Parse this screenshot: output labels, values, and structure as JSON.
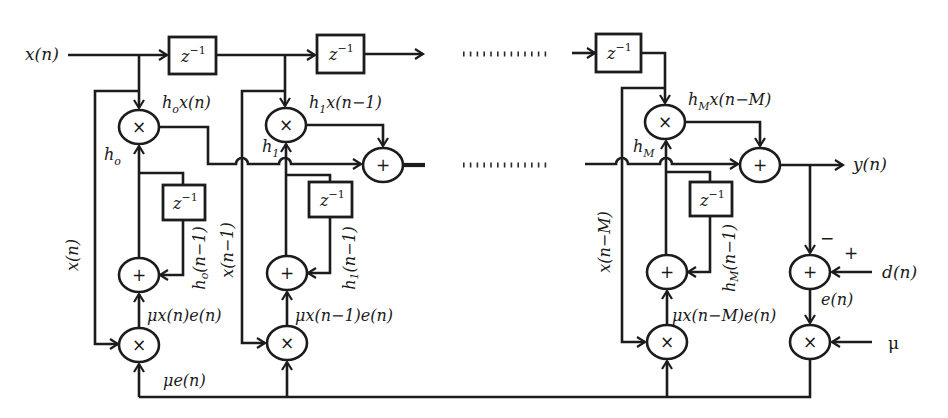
{
  "diagram": {
    "input_label": "x(n)",
    "output_label": "y(n)",
    "desired_label": "d(n)",
    "error_label": "e(n)",
    "step_size_label": "μ",
    "scaled_error_label": "μe(n)",
    "delay": {
      "base": "z",
      "exp": "−1"
    },
    "operators": {
      "multiply": "×",
      "add": "+"
    },
    "error_signs": {
      "minus": "−",
      "plus": "+"
    },
    "taps": [
      {
        "weight": {
          "base": "h",
          "sub": "o"
        },
        "product": {
          "base": "h",
          "sub": "o",
          "rest": "x(n)"
        },
        "feedback_input": "x(n)",
        "previous_weight": {
          "base": "h",
          "sub": "o",
          "rest": "(n−1)"
        },
        "update": "μx(n)e(n)"
      },
      {
        "weight": {
          "base": "h",
          "sub": "1"
        },
        "product": {
          "base": "h",
          "sub": "1",
          "rest": "x(n−1)"
        },
        "feedback_input": "x(n−1)",
        "previous_weight": {
          "base": "h",
          "sub": "1",
          "rest": "(n−1)"
        },
        "update": "μx(n−1)e(n)"
      },
      {
        "weight": {
          "base": "h",
          "sub": "M"
        },
        "product": {
          "base": "h",
          "sub": "M",
          "rest": "x(n−M)"
        },
        "feedback_input": "x(n−M)",
        "previous_weight": {
          "base": "h",
          "sub": "M",
          "rest": "(n−1)"
        },
        "update": "μx(n−M)e(n)"
      }
    ]
  }
}
